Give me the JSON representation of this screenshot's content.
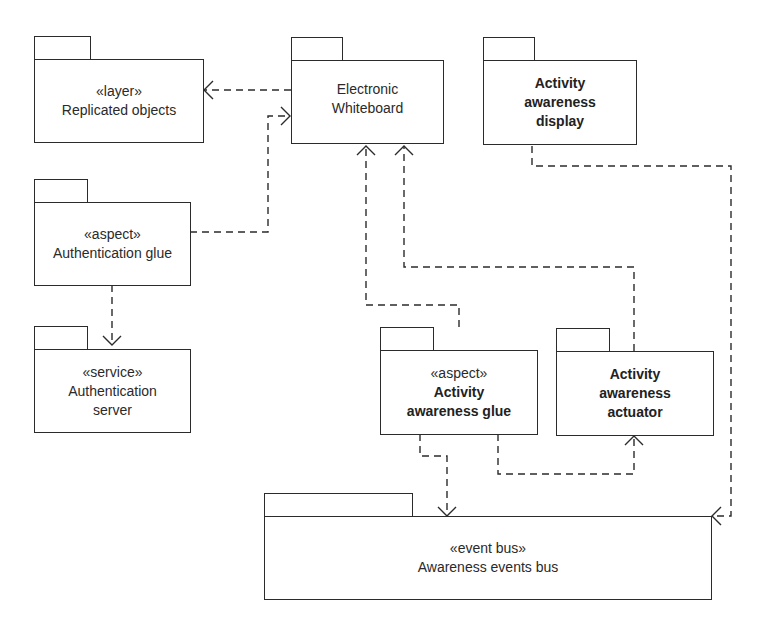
{
  "diagram": {
    "type": "UML package diagram",
    "packages": [
      {
        "id": "replicated",
        "stereotype": "«layer»",
        "name_lines": [
          "Replicated objects"
        ],
        "bold": false
      },
      {
        "id": "whiteboard",
        "stereotype": "",
        "name_lines": [
          "Electronic",
          "Whiteboard"
        ],
        "bold": false
      },
      {
        "id": "display",
        "stereotype": "",
        "name_lines": [
          "Activity",
          "awareness",
          "display"
        ],
        "bold": true
      },
      {
        "id": "authglue",
        "stereotype": "«aspect»",
        "name_lines": [
          "Authentication glue"
        ],
        "bold": false
      },
      {
        "id": "authserver",
        "stereotype": "«service»",
        "name_lines": [
          "Authentication",
          "server"
        ],
        "bold": false
      },
      {
        "id": "awglue",
        "stereotype": "«aspect»",
        "name_lines": [
          "Activity",
          "awareness glue"
        ],
        "bold": true
      },
      {
        "id": "actuator",
        "stereotype": "",
        "name_lines": [
          "Activity",
          "awareness",
          "actuator"
        ],
        "bold": true
      },
      {
        "id": "eventbus",
        "stereotype": "«event bus»",
        "name_lines": [
          "Awareness events bus"
        ],
        "bold": false
      }
    ],
    "dependencies": [
      {
        "from": "Electronic Whiteboard",
        "to": "Replicated objects"
      },
      {
        "from": "Authentication glue",
        "to": "Electronic Whiteboard"
      },
      {
        "from": "Authentication glue",
        "to": "Authentication server"
      },
      {
        "from": "Activity awareness glue",
        "to": "Electronic Whiteboard"
      },
      {
        "from": "Activity awareness actuator",
        "to": "Electronic Whiteboard"
      },
      {
        "from": "Activity awareness glue",
        "to": "Activity awareness actuator"
      },
      {
        "from": "Activity awareness glue",
        "to": "Awareness events bus"
      },
      {
        "from": "Activity awareness display",
        "to": "Awareness events bus"
      }
    ],
    "colors": {
      "line": "#2b2b2b",
      "background": "#ffffff",
      "text": "#2a2a2a"
    }
  }
}
